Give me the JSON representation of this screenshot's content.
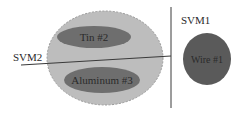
{
  "diagram": {
    "type": "svm-classification-diagram",
    "colors": {
      "background": "#ffffff",
      "outer_group_fill": "#bdbdbd",
      "outer_group_stroke": "#9a9a9a",
      "inner_class_fill": "#6e6e6e",
      "separate_class_fill": "#5a5a5a",
      "line_color": "#3a3a3a",
      "text_color": "#2a2a2a"
    },
    "classifiers": [
      {
        "id": "svm1",
        "label": "SVM1"
      },
      {
        "id": "svm2",
        "label": "SVM2"
      }
    ],
    "classes": [
      {
        "id": "tin",
        "label": "Tin #2"
      },
      {
        "id": "aluminum",
        "label": "Aluminum #3"
      },
      {
        "id": "wire",
        "label": "Wire #1"
      }
    ]
  }
}
